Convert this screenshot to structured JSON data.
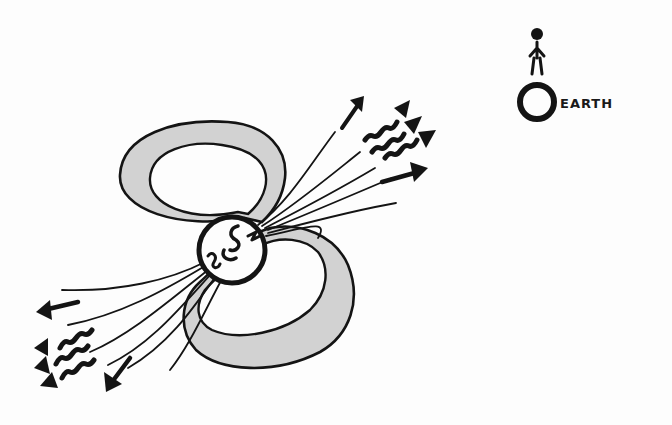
{
  "illustration": {
    "subject": "star-with-magnetic-field-and-jets",
    "earth_label": "EARTH",
    "colors": {
      "ink": "#141414",
      "field_lobe_fill": "#d2d2d2",
      "background": "#fdfdfd"
    }
  }
}
